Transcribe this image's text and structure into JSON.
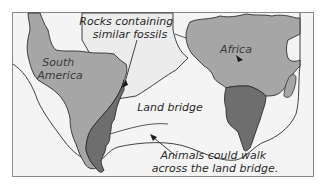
{
  "diagram": {
    "labels": {
      "south_america_line1": "South",
      "south_america_line2": "America",
      "africa": "Africa",
      "rocks_line1": "Rocks containing",
      "rocks_line2": "similar fossils",
      "land_bridge": "Land bridge",
      "animals_line1": "Animals could walk",
      "animals_line2": "across the land bridge."
    },
    "colors": {
      "background": "#ffffff",
      "frame_fill": "#f4f4f4",
      "frame_stroke": "#8a8a8a",
      "continent_fill": "#a6a6a6",
      "fossil_rock_fill": "#6e6e6e",
      "callout_fill": "#ececec",
      "outline": "#2e2e2e"
    },
    "elements": [
      "South America continent",
      "Africa continent",
      "Rocks containing similar fossils region (South America)",
      "Rocks containing similar fossils region (Africa)",
      "Land bridge outline",
      "Madagascar island",
      "Callout arrows"
    ]
  }
}
